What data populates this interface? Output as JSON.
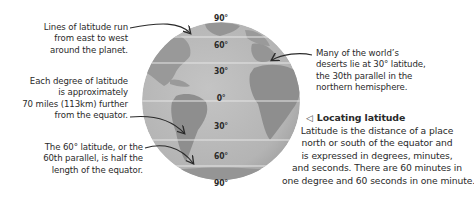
{
  "globe": {
    "colors": {
      "ocean": "#b9b9b9",
      "land": "#8f8f8f",
      "lines": "#e6e6e6",
      "arrows": "#2a2a2a"
    },
    "latitude_labels": [
      {
        "label": "90°",
        "x": 221,
        "y": 13
      },
      {
        "label": "60°",
        "x": 221,
        "y": 40
      },
      {
        "label": "30°",
        "x": 221,
        "y": 66
      },
      {
        "label": "0°",
        "x": 221,
        "y": 93
      },
      {
        "label": "30°",
        "x": 221,
        "y": 112
      },
      {
        "label": "60°",
        "x": 221,
        "y": 151
      },
      {
        "label": "90°",
        "x": 221,
        "y": 178
      }
    ]
  },
  "notes": {
    "lines_of_latitude": [
      "Lines of latitude run",
      "from east to west",
      "around the planet."
    ],
    "degree_distance": [
      "Each degree of latitude",
      "is approximately",
      "70 miles (113km) further",
      "from the equator."
    ],
    "sixtieth_parallel": [
      "The 60° latitude, or the",
      "60th parallel, is half the",
      "length of the equator."
    ],
    "deserts": [
      "Many of the world’s",
      "deserts lie at 30° latitude,",
      "the 30th parallel in the",
      "northern hemisphere."
    ]
  },
  "caption": {
    "icon": "left-triangle-icon",
    "icon_glyph": "◁",
    "title": "Locating latitude",
    "lines": [
      "Latitude is the distance of a place",
      "north or south of the equator and",
      "is expressed in degrees, minutes,",
      "and seconds. There are 60 minutes in",
      "one degree and 60 seconds in one minute."
    ]
  }
}
